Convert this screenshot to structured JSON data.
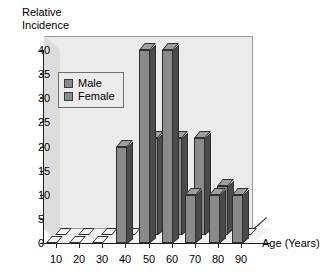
{
  "chart_data": {
    "type": "bar",
    "title": "",
    "xlabel": "Age (Years)",
    "ylabel": "Relative\nIncidence",
    "ylabel_line1": "Relative",
    "ylabel_line2": "Incidence",
    "categories": [
      "10",
      "20",
      "30",
      "40",
      "50",
      "60",
      "70",
      "80",
      "90"
    ],
    "series": [
      {
        "name": "Male",
        "values": [
          0,
          0,
          0,
          20,
          40,
          40,
          10,
          10,
          10
        ]
      },
      {
        "name": "Female",
        "values": [
          0,
          0,
          0,
          0,
          20,
          20,
          20,
          10,
          0
        ]
      }
    ],
    "ylim": [
      0,
      40
    ],
    "yticks": [
      "0",
      "5",
      "10",
      "15",
      "20",
      "25",
      "30",
      "35",
      "40"
    ],
    "ytick_values": [
      0,
      5,
      10,
      15,
      20,
      25,
      30,
      35,
      40
    ],
    "grid": false,
    "legend_position": "upper-left",
    "style": "3d-column"
  },
  "legend": {
    "items": [
      {
        "label": "Male",
        "color": "#8a8a8a"
      },
      {
        "label": "Female",
        "color": "#8a8a8a"
      }
    ]
  },
  "colors": {
    "bar_face": "#8a8a8a",
    "bar_side": "#4a4a4a",
    "bar_top": "#9f9f9f",
    "plot_background": "#ebebeb",
    "page_background": "#ffffff",
    "axis": "#1f1f1f"
  }
}
